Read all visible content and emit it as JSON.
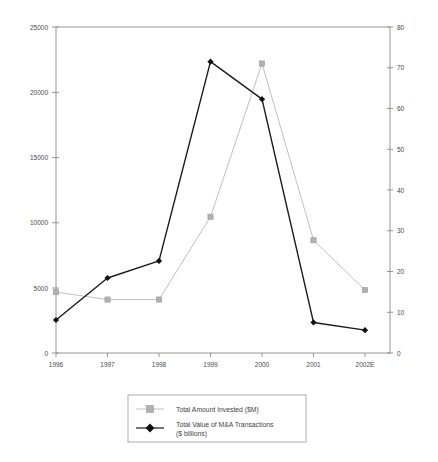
{
  "chart_data": {
    "type": "line",
    "title": "",
    "xlabel": "",
    "ylabel": "",
    "grid": false,
    "legend_position": "bottom-center",
    "categories": [
      "1996",
      "1997",
      "1998",
      "1999",
      "2000",
      "2001",
      "2002E"
    ],
    "axes": {
      "left": {
        "label": "",
        "ylim": [
          0,
          25000
        ],
        "ticks": [
          0,
          5000,
          10000,
          15000,
          20000,
          25000
        ],
        "tick_labels": [
          "0",
          "5000",
          "10000",
          "15000",
          "20000",
          "25000"
        ]
      },
      "right": {
        "label": "",
        "ylim": [
          0,
          80
        ],
        "ticks": [
          0,
          10,
          20,
          30,
          40,
          50,
          60,
          70,
          80
        ],
        "tick_labels": [
          "0",
          "10",
          "20",
          "30",
          "40",
          "50",
          "60",
          "70",
          "80"
        ]
      }
    },
    "series": [
      {
        "name": "Total Amount Invested ($M)",
        "axis": "left",
        "color": "#b8b8b8",
        "marker": "square",
        "values": [
          4670,
          4100,
          4100,
          10450,
          22200,
          8650,
          4830
        ]
      },
      {
        "name": "Total Value of  M&A Transactions ($ billions)",
        "axis": "right",
        "color": "#1a1a1a",
        "marker": "diamond",
        "values": [
          8.1,
          18.4,
          22.6,
          71.5,
          62.3,
          7.5,
          5.6
        ]
      }
    ],
    "legend": [
      {
        "label": "Total Amount Invested ($M)",
        "label_line2": "",
        "color": "#b8b8b8",
        "marker": "square"
      },
      {
        "label": "Total Value of  M&A Transactions",
        "label_line2": "($ billions)",
        "color": "#1a1a1a",
        "marker": "diamond"
      }
    ]
  }
}
